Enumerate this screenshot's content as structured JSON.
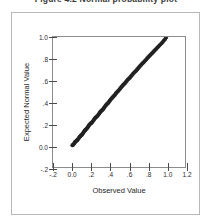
{
  "caption": {
    "text": "Figure 4.2   Normal probability plot"
  },
  "chart_data": {
    "type": "scatter",
    "title": "",
    "xlabel": "Observed Value",
    "ylabel": "Expected Normal Value",
    "xlim": [
      -0.2,
      1.2
    ],
    "ylim": [
      -0.2,
      1.0
    ],
    "xticks": [
      -0.2,
      0.0,
      0.2,
      0.4,
      0.6,
      0.8,
      1.0,
      1.2
    ],
    "xticklabels": [
      "-.2",
      "0.0",
      ".2",
      ".4",
      ".6",
      ".8",
      "1.0",
      "1.2"
    ],
    "yticks": [
      -0.2,
      0.0,
      0.2,
      0.4,
      0.6,
      0.8,
      1.0
    ],
    "yticklabels": [
      "-.2",
      "0.0",
      ".2",
      ".4",
      ".6",
      ".8",
      "1.0"
    ],
    "grid": false,
    "legend": false,
    "marker": "filled-circle",
    "marker_color": "#222222",
    "marker_size": 2.0,
    "series": [
      {
        "name": "Normal Q-Q",
        "x": [
          0.005,
          0.012,
          0.018,
          0.024,
          0.03,
          0.034,
          0.04,
          0.047,
          0.052,
          0.058,
          0.063,
          0.07,
          0.076,
          0.082,
          0.088,
          0.094,
          0.1,
          0.106,
          0.112,
          0.118,
          0.125,
          0.131,
          0.137,
          0.142,
          0.148,
          0.155,
          0.161,
          0.168,
          0.174,
          0.18,
          0.186,
          0.193,
          0.199,
          0.206,
          0.212,
          0.219,
          0.226,
          0.232,
          0.239,
          0.245,
          0.252,
          0.258,
          0.265,
          0.272,
          0.278,
          0.285,
          0.292,
          0.299,
          0.305,
          0.312,
          0.319,
          0.326,
          0.333,
          0.34,
          0.347,
          0.354,
          0.361,
          0.368,
          0.375,
          0.382,
          0.389,
          0.396,
          0.404,
          0.411,
          0.418,
          0.426,
          0.433,
          0.44,
          0.448,
          0.455,
          0.463,
          0.47,
          0.478,
          0.486,
          0.493,
          0.501,
          0.509,
          0.517,
          0.525,
          0.533,
          0.541,
          0.549,
          0.557,
          0.565,
          0.573,
          0.581,
          0.59,
          0.598,
          0.606,
          0.615,
          0.623,
          0.632,
          0.641,
          0.649,
          0.658,
          0.667,
          0.676,
          0.685,
          0.694,
          0.703,
          0.712,
          0.721,
          0.731,
          0.74,
          0.75,
          0.759,
          0.769,
          0.779,
          0.789,
          0.799,
          0.809,
          0.819,
          0.829,
          0.84,
          0.85,
          0.861,
          0.872,
          0.883,
          0.894,
          0.905,
          0.917,
          0.928,
          0.94,
          0.952,
          0.964,
          0.976,
          0.988,
          1.0
        ],
        "y": [
          0.0,
          0.004,
          0.009,
          0.017,
          0.026,
          0.03,
          0.035,
          0.041,
          0.045,
          0.049,
          0.054,
          0.062,
          0.07,
          0.077,
          0.083,
          0.088,
          0.093,
          0.098,
          0.104,
          0.112,
          0.121,
          0.129,
          0.136,
          0.141,
          0.146,
          0.152,
          0.158,
          0.166,
          0.175,
          0.183,
          0.19,
          0.196,
          0.201,
          0.206,
          0.211,
          0.218,
          0.226,
          0.235,
          0.243,
          0.25,
          0.256,
          0.261,
          0.266,
          0.272,
          0.279,
          0.288,
          0.297,
          0.305,
          0.312,
          0.318,
          0.323,
          0.329,
          0.336,
          0.344,
          0.353,
          0.362,
          0.37,
          0.377,
          0.383,
          0.389,
          0.396,
          0.404,
          0.413,
          0.422,
          0.43,
          0.437,
          0.444,
          0.45,
          0.457,
          0.465,
          0.474,
          0.483,
          0.491,
          0.498,
          0.505,
          0.512,
          0.52,
          0.529,
          0.538,
          0.546,
          0.554,
          0.561,
          0.568,
          0.576,
          0.585,
          0.594,
          0.603,
          0.611,
          0.618,
          0.625,
          0.633,
          0.642,
          0.651,
          0.66,
          0.669,
          0.677,
          0.685,
          0.693,
          0.702,
          0.711,
          0.721,
          0.73,
          0.739,
          0.748,
          0.757,
          0.765,
          0.774,
          0.783,
          0.793,
          0.803,
          0.813,
          0.822,
          0.832,
          0.841,
          0.85,
          0.86,
          0.87,
          0.88,
          0.89,
          0.9,
          0.911,
          0.921,
          0.932,
          0.943,
          0.955,
          0.967,
          0.98,
          0.995
        ]
      }
    ]
  }
}
